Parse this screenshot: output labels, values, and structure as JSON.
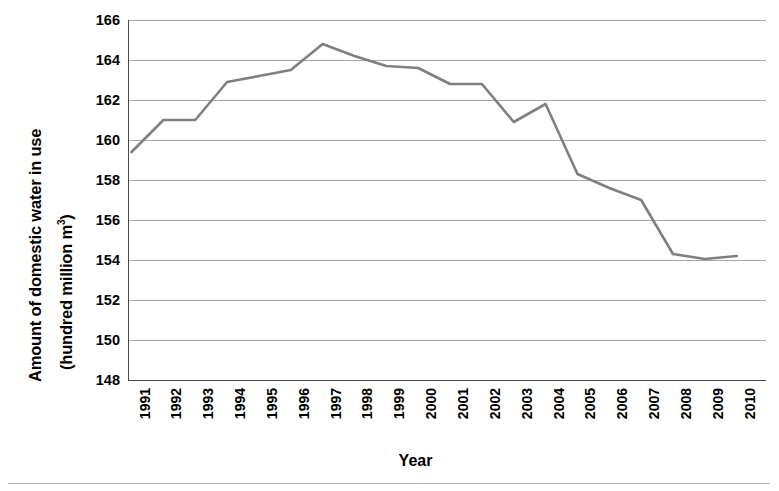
{
  "chart_data": {
    "type": "line",
    "title": "",
    "xlabel": "Year",
    "ylabel": "Amount of domestic water in use (hundred million m3)",
    "ylabel_line1": "Amount of domestic water in use",
    "ylabel_line2_prefix": "(hundred million m",
    "ylabel_line2_sup": "3",
    "ylabel_line2_suffix": ")",
    "categories": [
      "1991",
      "1992",
      "1993",
      "1994",
      "1995",
      "1996",
      "1997",
      "1998",
      "1999",
      "2000",
      "2001",
      "2002",
      "2003",
      "2004",
      "2005",
      "2006",
      "2007",
      "2008",
      "2009",
      "2010"
    ],
    "values": [
      159.4,
      161.0,
      161.0,
      162.9,
      163.2,
      163.5,
      164.8,
      164.2,
      163.7,
      163.6,
      162.8,
      162.8,
      160.9,
      161.8,
      158.3,
      157.6,
      157.0,
      154.3,
      154.05,
      154.2
    ],
    "yticks": [
      166,
      164,
      162,
      160,
      158,
      156,
      154,
      152,
      150,
      148
    ],
    "ylim": [
      148,
      166
    ],
    "ytick_step": 2,
    "xlim_categories": 20,
    "grid": "horizontal",
    "legend": "none",
    "series": [
      {
        "name": "Amount of domestic water in use",
        "color": "#7f7f7f",
        "values": [
          159.4,
          161.0,
          161.0,
          162.9,
          163.2,
          163.5,
          164.8,
          164.2,
          163.7,
          163.6,
          162.8,
          162.8,
          160.9,
          161.8,
          158.3,
          157.6,
          157.0,
          154.3,
          154.05,
          154.2
        ]
      }
    ]
  },
  "colors": {
    "line": "#7f7f7f",
    "grid": "#a6a6a6",
    "axis": "#4a4a4a",
    "text": "#000000"
  }
}
